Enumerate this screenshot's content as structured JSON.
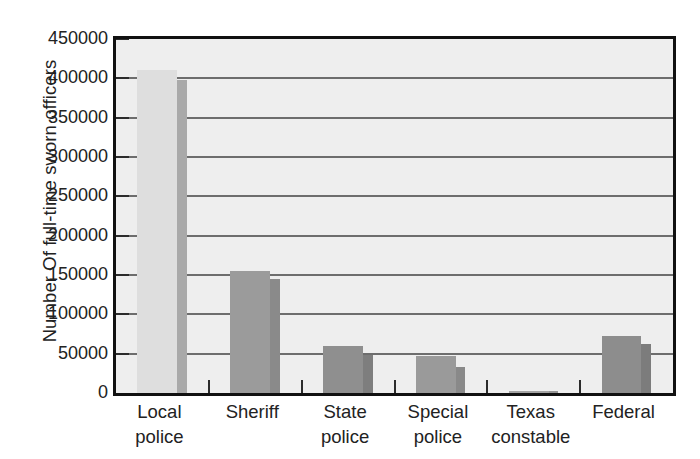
{
  "chart_data": {
    "type": "bar",
    "title": "",
    "xlabel": "",
    "ylabel": "Number Of full-time sworn officers",
    "categories": [
      "Local police",
      "Sheriff",
      "State police",
      "Special police",
      "Texas constable",
      "Federal"
    ],
    "category_lines": [
      [
        "Local",
        "police"
      ],
      [
        "Sheriff",
        ""
      ],
      [
        "State",
        "police"
      ],
      [
        "Special",
        "police"
      ],
      [
        "Texas",
        "constable"
      ],
      [
        "Federal",
        ""
      ]
    ],
    "values": [
      410000,
      155000,
      60000,
      47000,
      3000,
      72000
    ],
    "side_values": [
      398000,
      145000,
      48000,
      33000,
      2500,
      62000
    ],
    "ylim": [
      0,
      450000
    ],
    "yticks": [
      0,
      50000,
      100000,
      150000,
      200000,
      250000,
      300000,
      350000,
      400000,
      450000
    ],
    "ytick_labels": [
      "0",
      "50000",
      "100000",
      "150000",
      "200000",
      "250000",
      "300000",
      "350000",
      "400000",
      "450000"
    ],
    "grid": true,
    "legend": false,
    "legend_position": "none",
    "bar_face_colors": [
      "#dedede",
      "#9b9b9b",
      "#8f8f8f",
      "#9a9a9a",
      "#a3a3a3",
      "#8d8d8d"
    ],
    "bar_side_colors": [
      "#a9a9a9",
      "#8a8a8a",
      "#7e7e7e",
      "#898989",
      "#949494",
      "#7c7c7c"
    ],
    "plot_background": "#eeeeee",
    "frame_color": "#111111",
    "gridline_color": "#6d6d6d",
    "text_color": "#222222"
  }
}
